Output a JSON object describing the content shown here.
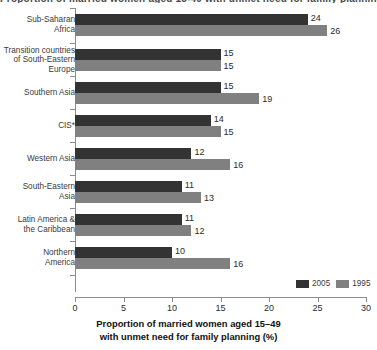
{
  "chart_data": {
    "type": "bar",
    "orientation": "horizontal",
    "title": "Proportion of married women aged 15-49 with unmet need for family planning (%)",
    "xlabel_line1": "Proportion of married women aged 15–49",
    "xlabel_line2": "with unmet need for family planning (%)",
    "ylabel": "",
    "xlim": [
      0,
      30
    ],
    "xticks": [
      0,
      5,
      10,
      15,
      20,
      25,
      30
    ],
    "xtick_labels": [
      "0",
      "5",
      "10",
      "15",
      "20",
      "25",
      "30"
    ],
    "grid": false,
    "legend_position": "bottom-right",
    "categories": [
      "Sub-Saharan\nAfrica",
      "Transition countries\nof South-Eastern\nEurope",
      "Southern Asia",
      "CIS*",
      "Western Asia",
      "South-Eastern\nAsia",
      "Latin America &\nthe Caribbean",
      "Northern\nAmerica"
    ],
    "series": [
      {
        "name": "2005",
        "color": "#333333",
        "values": [
          24,
          15,
          15,
          14,
          12,
          11,
          11,
          10
        ],
        "value_labels": [
          "24",
          "15",
          "15",
          "14",
          "12",
          "11",
          "11",
          "10"
        ]
      },
      {
        "name": "1995",
        "color": "#808080",
        "values": [
          26,
          15,
          19,
          15,
          16,
          13,
          12,
          16
        ],
        "value_labels": [
          "26",
          "15",
          "19",
          "15",
          "16",
          "13",
          "12",
          "16"
        ]
      }
    ],
    "footnote": "CIS*"
  },
  "legend": {
    "items": [
      {
        "label": "2005",
        "color": "#333333"
      },
      {
        "label": "1995",
        "color": "#808080"
      }
    ]
  }
}
